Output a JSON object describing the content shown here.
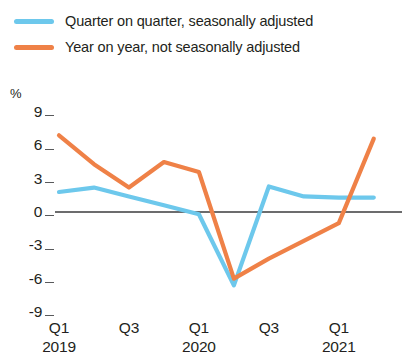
{
  "chart_data": {
    "type": "line",
    "title": "",
    "subtitle": "",
    "xlabel": "",
    "ylabel": "%",
    "ylim": [
      -9,
      9
    ],
    "yticks": [
      9,
      6,
      3,
      0,
      -3,
      -6,
      -9
    ],
    "ytick_labels": [
      "9",
      "6",
      "3",
      "0",
      "-3",
      "-6",
      "-9"
    ],
    "grid": false,
    "zero_line": true,
    "legend_position": "top-left",
    "x": [
      "Q1 2019",
      "Q2 2019",
      "Q3 2019",
      "Q4 2019",
      "Q1 2020",
      "Q2 2020",
      "Q3 2020",
      "Q4 2020",
      "Q1 2021",
      "Q2 2021"
    ],
    "xtick_labels": [
      {
        "quarter": "Q1",
        "year": "2019"
      },
      {
        "quarter": "Q3",
        "year": ""
      },
      {
        "quarter": "Q1",
        "year": "2020"
      },
      {
        "quarter": "Q3",
        "year": ""
      },
      {
        "quarter": "Q1",
        "year": "2021"
      }
    ],
    "series": [
      {
        "name": "Quarter on quarter, seasonally adjusted",
        "color": "#6dc8ec",
        "values": [
          1.8,
          2.2,
          1.4,
          0.6,
          -0.2,
          -6.6,
          2.3,
          1.4,
          1.3,
          1.3
        ]
      },
      {
        "name": "Year on year, not seasonally adjusted",
        "color": "#ef8147",
        "values": [
          6.9,
          4.3,
          2.2,
          4.5,
          3.6,
          -6.0,
          -4.2,
          -2.6,
          -1.0,
          6.6
        ]
      }
    ]
  },
  "legend": {
    "items": [
      {
        "label": "Quarter on quarter, seasonally adjusted",
        "color": "#6dc8ec"
      },
      {
        "label": "Year on year, not seasonally adjusted",
        "color": "#ef8147"
      }
    ]
  },
  "axis": {
    "unit": "%"
  }
}
